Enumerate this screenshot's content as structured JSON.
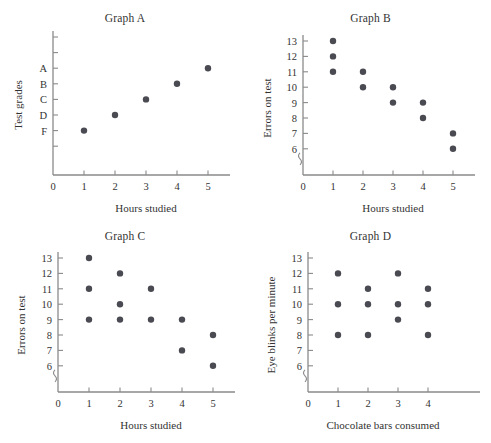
{
  "figure": {
    "background": "#ffffff",
    "dot_color": "#4a4a52",
    "axis_color": "#8a8a8a",
    "text_color": "#333333"
  },
  "panels": [
    {
      "key": "graph_a",
      "title": "Graph  A",
      "xlabel": "Hours studied",
      "ylabel": "Test grades",
      "origin_label": "0"
    },
    {
      "key": "graph_b",
      "title": "Graph B",
      "xlabel": "Hours studied",
      "ylabel": "Errors on test",
      "origin_label": "0"
    },
    {
      "key": "graph_c",
      "title": "Graph C",
      "xlabel": "Hours studied",
      "ylabel": "Errors on test",
      "origin_label": "0"
    },
    {
      "key": "graph_d",
      "title": "Graph D",
      "xlabel": "Chocolate bars consumed",
      "ylabel": "Eye blinks per minute",
      "origin_label": "0"
    }
  ],
  "chart_data": [
    {
      "type": "scatter",
      "key": "graph_a",
      "title": "Graph  A",
      "xlabel": "Hours studied",
      "ylabel": "Test grades",
      "x_ticks": [
        1,
        2,
        3,
        4,
        5
      ],
      "x_tick_labels": [
        "1",
        "2",
        "3",
        "4",
        "5"
      ],
      "origin_label": "0",
      "y_tick_labels": [
        "",
        "",
        "A",
        "B",
        "C",
        "D",
        "F",
        ""
      ],
      "y_categories": [
        "A",
        "B",
        "C",
        "D",
        "F"
      ],
      "grid": false,
      "legend": "none",
      "axis_break": false,
      "points": [
        {
          "x": 1,
          "y": "F"
        },
        {
          "x": 2,
          "y": "D"
        },
        {
          "x": 3,
          "y": "C"
        },
        {
          "x": 4,
          "y": "B"
        },
        {
          "x": 5,
          "y": "A"
        }
      ]
    },
    {
      "type": "scatter",
      "key": "graph_b",
      "title": "Graph B",
      "xlabel": "Hours studied",
      "ylabel": "Errors on test",
      "x_ticks": [
        1,
        2,
        3,
        4,
        5
      ],
      "x_tick_labels": [
        "1",
        "2",
        "3",
        "4",
        "5"
      ],
      "origin_label": "0",
      "y_ticks": [
        6,
        7,
        8,
        9,
        10,
        11,
        12,
        13
      ],
      "y_tick_labels": [
        "6",
        "7",
        "8",
        "9",
        "10",
        "11",
        "12",
        "13"
      ],
      "ylim": [
        6,
        13
      ],
      "grid": false,
      "legend": "none",
      "axis_break": true,
      "points": [
        {
          "x": 1,
          "y": 13
        },
        {
          "x": 1,
          "y": 12
        },
        {
          "x": 1,
          "y": 11
        },
        {
          "x": 2,
          "y": 11
        },
        {
          "x": 2,
          "y": 10
        },
        {
          "x": 3,
          "y": 10
        },
        {
          "x": 3,
          "y": 9
        },
        {
          "x": 4,
          "y": 9
        },
        {
          "x": 4,
          "y": 8
        },
        {
          "x": 5,
          "y": 7
        },
        {
          "x": 5,
          "y": 6
        }
      ]
    },
    {
      "type": "scatter",
      "key": "graph_c",
      "title": "Graph C",
      "xlabel": "Hours studied",
      "ylabel": "Errors on test",
      "x_ticks": [
        1,
        2,
        3,
        4,
        5
      ],
      "x_tick_labels": [
        "1",
        "2",
        "3",
        "4",
        "5"
      ],
      "origin_label": "0",
      "y_ticks": [
        6,
        7,
        8,
        9,
        10,
        11,
        12,
        13
      ],
      "y_tick_labels": [
        "6",
        "7",
        "8",
        "9",
        "10",
        "11",
        "12",
        "13"
      ],
      "ylim": [
        6,
        13
      ],
      "grid": false,
      "legend": "none",
      "axis_break": true,
      "points": [
        {
          "x": 1,
          "y": 13
        },
        {
          "x": 1,
          "y": 11
        },
        {
          "x": 1,
          "y": 9
        },
        {
          "x": 2,
          "y": 12
        },
        {
          "x": 2,
          "y": 10
        },
        {
          "x": 2,
          "y": 9
        },
        {
          "x": 3,
          "y": 11
        },
        {
          "x": 3,
          "y": 9
        },
        {
          "x": 4,
          "y": 9
        },
        {
          "x": 4,
          "y": 7
        },
        {
          "x": 5,
          "y": 8
        },
        {
          "x": 5,
          "y": 6
        }
      ]
    },
    {
      "type": "scatter",
      "key": "graph_d",
      "title": "Graph D",
      "xlabel": "Chocolate bars consumed",
      "ylabel": "Eye blinks per minute",
      "x_ticks": [
        1,
        2,
        3,
        4
      ],
      "x_tick_labels": [
        "1",
        "2",
        "3",
        "4"
      ],
      "origin_label": "0",
      "y_ticks": [
        6,
        7,
        8,
        9,
        10,
        11,
        12,
        13
      ],
      "y_tick_labels": [
        "6",
        "7",
        "8",
        "9",
        "10",
        "11",
        "12",
        "13"
      ],
      "ylim": [
        6,
        13
      ],
      "grid": false,
      "legend": "none",
      "axis_break": true,
      "points": [
        {
          "x": 1,
          "y": 12
        },
        {
          "x": 1,
          "y": 10
        },
        {
          "x": 1,
          "y": 8
        },
        {
          "x": 2,
          "y": 11
        },
        {
          "x": 2,
          "y": 10
        },
        {
          "x": 2,
          "y": 8
        },
        {
          "x": 3,
          "y": 12
        },
        {
          "x": 3,
          "y": 10
        },
        {
          "x": 3,
          "y": 9
        },
        {
          "x": 4,
          "y": 11
        },
        {
          "x": 4,
          "y": 10
        },
        {
          "x": 4,
          "y": 8
        }
      ]
    }
  ]
}
